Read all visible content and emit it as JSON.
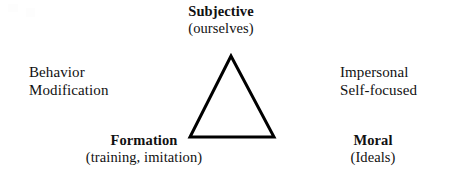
{
  "diagram": {
    "type": "triangle-concept-diagram",
    "background_color": "#ffffff",
    "ink_color": "#111111",
    "shape": {
      "name": "triangle",
      "stroke_color": "#000000",
      "stroke_width": 3,
      "fill": "none",
      "vertices": {
        "apex": {
          "x": 231,
          "y": 56
        },
        "base_left": {
          "x": 190,
          "y": 137
        },
        "base_right": {
          "x": 274,
          "y": 137
        }
      }
    },
    "labels": {
      "apex": {
        "position": "top",
        "title": "Subjective",
        "subtitle": "(ourselves)"
      },
      "base_left": {
        "position": "bottom-left",
        "title": "Formation",
        "subtitle": "(training, imitation)"
      },
      "base_right": {
        "position": "bottom-right",
        "title": "Moral",
        "subtitle": "(Ideals)"
      }
    },
    "flanking_text": {
      "left": {
        "line1": "Behavior",
        "line2": "Modification"
      },
      "right": {
        "line1": "Impersonal",
        "line2": "Self-focused"
      }
    }
  }
}
